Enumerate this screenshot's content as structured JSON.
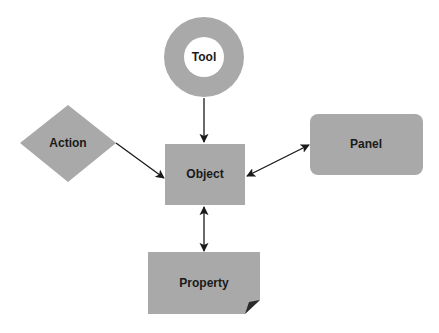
{
  "diagram": {
    "colors": {
      "node_fill": "#a9a9a9",
      "ring_inner": "#ffffff",
      "text": "#1a1a1a",
      "arrow": "#1a1a1a",
      "fold": "#2a2a2a"
    },
    "nodes": {
      "tool": {
        "label": "Tool",
        "shape": "ring"
      },
      "action": {
        "label": "Action",
        "shape": "diamond"
      },
      "object": {
        "label": "Object",
        "shape": "rectangle"
      },
      "panel": {
        "label": "Panel",
        "shape": "rounded-rectangle"
      },
      "property": {
        "label": "Property",
        "shape": "note-folded-corner"
      }
    },
    "edges": [
      {
        "from": "Tool",
        "to": "Object",
        "direction": "one-way"
      },
      {
        "from": "Action",
        "to": "Object",
        "direction": "one-way"
      },
      {
        "from": "Object",
        "to": "Panel",
        "direction": "two-way"
      },
      {
        "from": "Object",
        "to": "Property",
        "direction": "two-way"
      }
    ]
  }
}
